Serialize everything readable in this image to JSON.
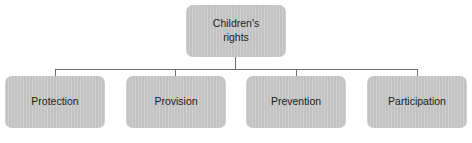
{
  "diagram": {
    "type": "hierarchy-tree",
    "background_color": "#ffffff",
    "node_fill_color": "#c2c2c2",
    "node_text_color": "#1d1d1d",
    "connector_color": "#6e6e6e",
    "root": {
      "label": "Children's\nrights"
    },
    "children": [
      {
        "label": "Protection"
      },
      {
        "label": "Provision"
      },
      {
        "label": "Prevention"
      },
      {
        "label": "Participation"
      }
    ]
  }
}
